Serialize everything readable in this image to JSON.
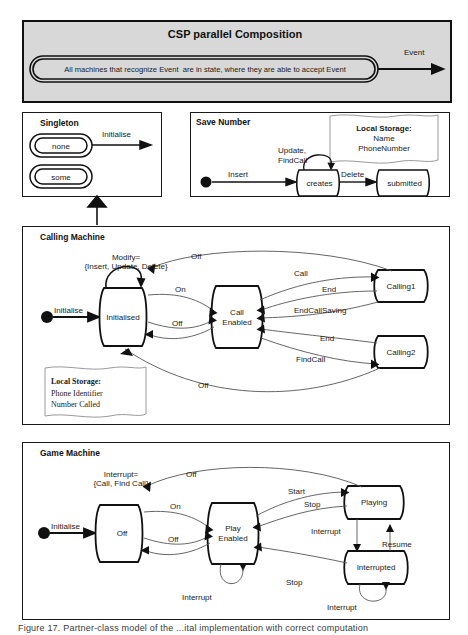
{
  "figure": {
    "caption": "Figure 17. Partner-class model of the ...ital implementation with correct computation",
    "caption_visible_part": "Figure 17. Partner class model of the ... the component-based software"
  },
  "csp_panel": {
    "title": "CSP parallel Composition",
    "capsule_text": "All machines that recognize Event  are in state, where they are able to accept Event",
    "arrow_label": "Event",
    "fill_color": "#d8d8d8",
    "border_color": "#111111"
  },
  "singleton_panel": {
    "title": "Singleton",
    "states": [
      "none",
      "some"
    ],
    "transitions": [
      {
        "label": "Initialise"
      }
    ]
  },
  "save_number_panel": {
    "title": "Save Number",
    "states": [
      "creates",
      "submitted"
    ],
    "initial_marker": true,
    "transitions": [
      {
        "label": "Insert"
      },
      {
        "label": "Update,\nFindCall"
      },
      {
        "label": "Update,"
      },
      {
        "label": "FindCall"
      },
      {
        "label": "Delete"
      }
    ],
    "note": {
      "title": "Local Storage:",
      "lines": [
        "Name",
        "PhoneNumber"
      ]
    }
  },
  "calling_machine_panel": {
    "title": "Calling Machine",
    "states": [
      "Initialised",
      "Call\nEnabled",
      "Call",
      "Enabled",
      "Calling1",
      "Calling2"
    ],
    "macro_label_line1": "Modify=",
    "macro_label_line2": "{Insert, Update, Delete}",
    "transitions": [
      {
        "label": "Initialise"
      },
      {
        "label": "Off"
      },
      {
        "label": "On"
      },
      {
        "label": "Off"
      },
      {
        "label": "Off"
      },
      {
        "label": "Call"
      },
      {
        "label": "End"
      },
      {
        "label": "EndCallSaving"
      },
      {
        "label": "End"
      },
      {
        "label": "FindCall"
      }
    ],
    "note": {
      "title": "Local Storage:",
      "lines": [
        "Phone Identifier",
        "Number Called"
      ]
    }
  },
  "game_machine_panel": {
    "title": "Game Machine",
    "states": [
      "Off",
      "Play\nEnabled",
      "Play",
      "Enabled",
      "Playing",
      "Interrupted"
    ],
    "macro_label_line1": "Interrupt=",
    "macro_label_line2": "{Call, Find Call}",
    "transitions": [
      {
        "label": "Initialise"
      },
      {
        "label": "Off"
      },
      {
        "label": "On"
      },
      {
        "label": "Off"
      },
      {
        "label": "Start"
      },
      {
        "label": "Stop"
      },
      {
        "label": "Interrupt"
      },
      {
        "label": "Resume"
      },
      {
        "label": "Stop"
      },
      {
        "label": "Interrupt"
      },
      {
        "label": "Interrupt"
      }
    ]
  }
}
